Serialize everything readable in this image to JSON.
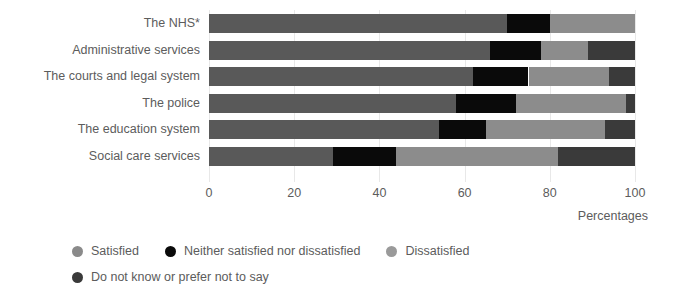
{
  "chart_data": {
    "type": "bar",
    "orientation": "horizontal",
    "stacked": true,
    "title": "",
    "xlabel": "Percentages",
    "ylabel": "",
    "xlim": [
      0,
      100
    ],
    "xticks": [
      0,
      20,
      40,
      60,
      80,
      100
    ],
    "grid": true,
    "legend_position": "bottom-left",
    "categories": [
      "The NHS*",
      "Administrative services",
      "The courts and legal system",
      "The police",
      "The education system",
      "Social care services"
    ],
    "series": [
      {
        "name": "Satisfied",
        "color": "#595959",
        "values": [
          70,
          66,
          62,
          58,
          54,
          29
        ]
      },
      {
        "name": "Neither satisfied nor dissatisfied",
        "color": "#0a0a0a",
        "values": [
          10,
          12,
          13,
          14,
          11,
          15
        ]
      },
      {
        "name": "Dissatisfied",
        "color": "#8c8c8c",
        "values": [
          20,
          11,
          19,
          26,
          28,
          38
        ]
      },
      {
        "name": "Do not know or prefer not to say",
        "color": "#3a3a3a",
        "values": [
          0,
          11,
          6,
          2,
          7,
          18
        ]
      }
    ]
  },
  "axis": {
    "tick_labels": [
      "0",
      "20",
      "40",
      "60",
      "80",
      "100"
    ],
    "x_title": "Percentages"
  },
  "legend": {
    "rows": [
      [
        {
          "label": "Satisfied",
          "color": "#8a8a8a"
        },
        {
          "label": "Neither satisfied nor dissatisfied",
          "color": "#0a0a0a"
        },
        {
          "label": "Dissatisfied",
          "color": "#9a9a9a"
        }
      ],
      [
        {
          "label": "Do not know or prefer not to say",
          "color": "#3a3a3a"
        }
      ]
    ]
  },
  "colors": {
    "satisfied": "#595959",
    "neither": "#0a0a0a",
    "dissatisfied": "#8c8c8c",
    "dont_know": "#3a3a3a",
    "grid": "#e8e8e8",
    "text": "#5c5c5c",
    "background": "#ffffff"
  }
}
